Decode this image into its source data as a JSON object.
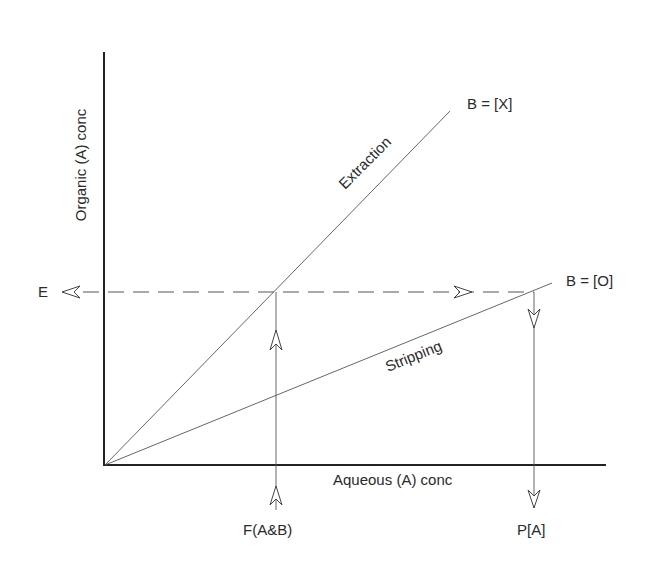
{
  "diagram": {
    "type": "mccabe-thiele-extraction-stripping",
    "axes": {
      "y_label": "Organic (A) conc",
      "x_label": "Aqueous (A) conc"
    },
    "lines": [
      {
        "name": "extraction",
        "label": "Extraction",
        "end_label": "B = [X]"
      },
      {
        "name": "stripping",
        "label": "Stripping",
        "end_label": "B = [O]"
      }
    ],
    "flows": {
      "feed": "F(A&B)",
      "product": "P[A]",
      "extract": "E"
    }
  }
}
